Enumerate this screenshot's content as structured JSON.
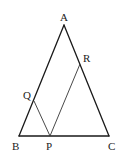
{
  "diagram": {
    "type": "geometry",
    "shape": "triangle",
    "points": {
      "A": {
        "label": "A",
        "x": 64,
        "y": 25
      },
      "B": {
        "label": "B",
        "x": 19,
        "y": 136
      },
      "C": {
        "label": "C",
        "x": 109,
        "y": 136
      },
      "P": {
        "label": "P",
        "x": 50,
        "y": 136
      },
      "Q": {
        "label": "Q",
        "x": 34,
        "y": 101
      },
      "R": {
        "label": "R",
        "x": 80,
        "y": 64
      }
    },
    "segments": [
      {
        "from": "A",
        "to": "B"
      },
      {
        "from": "A",
        "to": "C"
      },
      {
        "from": "B",
        "to": "C"
      },
      {
        "from": "P",
        "to": "Q"
      },
      {
        "from": "P",
        "to": "R"
      }
    ],
    "colors": {
      "line": "#1a1a1a",
      "text": "#222222",
      "background": "#ffffff"
    }
  }
}
